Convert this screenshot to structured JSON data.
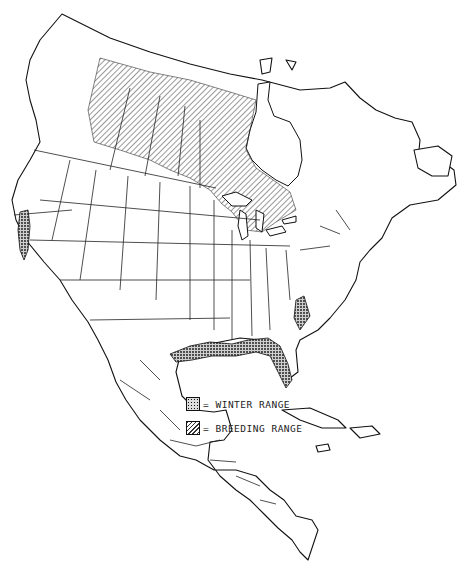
{
  "map": {
    "region": "North America",
    "colors": {
      "line": "#111111",
      "background": "#ffffff"
    }
  },
  "legend": {
    "items": [
      {
        "symbol": "stipple",
        "label": "= WINTER RANGE"
      },
      {
        "symbol": "hatch",
        "label": "= BREEDING RANGE"
      }
    ]
  }
}
